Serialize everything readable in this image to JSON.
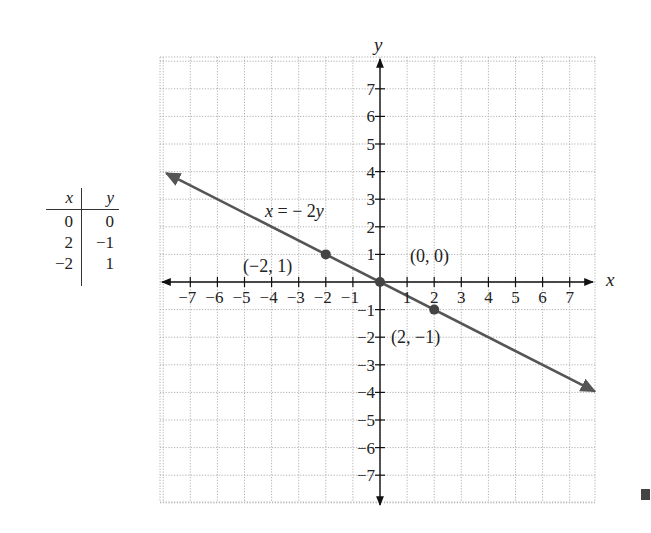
{
  "table": {
    "headers": [
      "x",
      "y"
    ],
    "rows": [
      {
        "x": "0",
        "y": "0"
      },
      {
        "x": "2",
        "y": "−1"
      },
      {
        "x": "−2",
        "y": "1"
      }
    ]
  },
  "labels": {
    "equation": "x = − 2y",
    "x_axis": "x",
    "y_axis": "y",
    "point_a": "(−2, 1)",
    "point_b": "(0, 0)",
    "point_c": "(2, −1)"
  },
  "colors": {
    "line": "#555555",
    "axis": "#111111",
    "grid": "#b0b0b0",
    "point": "#444444"
  },
  "chart_data": {
    "type": "line",
    "title": "",
    "equation": "x = -2y",
    "xlabel": "x",
    "ylabel": "y",
    "xlim": [
      -8,
      8
    ],
    "ylim": [
      -8,
      8
    ],
    "grid": true,
    "x_ticks": [
      -7,
      -6,
      -5,
      -4,
      -3,
      -2,
      -1,
      1,
      2,
      3,
      4,
      5,
      6,
      7
    ],
    "y_ticks": [
      -7,
      -6,
      -5,
      -4,
      -3,
      -2,
      -1,
      1,
      2,
      3,
      4,
      5,
      6,
      7
    ],
    "series": [
      {
        "name": "x = -2y",
        "x": [
          -8,
          8
        ],
        "y": [
          4,
          -4
        ]
      }
    ],
    "points": [
      {
        "x": -2,
        "y": 1,
        "label": "(−2, 1)"
      },
      {
        "x": 0,
        "y": 0,
        "label": "(0, 0)"
      },
      {
        "x": 2,
        "y": -1,
        "label": "(2, −1)"
      }
    ],
    "table": {
      "columns": [
        "x",
        "y"
      ],
      "rows": [
        [
          0,
          0
        ],
        [
          2,
          -1
        ],
        [
          -2,
          1
        ]
      ]
    }
  }
}
